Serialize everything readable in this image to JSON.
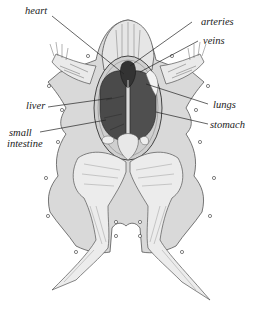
{
  "diagram": {
    "colors": {
      "skin": "#d9d9d9",
      "organ_dark": "#4a4a4a",
      "line": "#2a2a2a",
      "background": "#ffffff"
    },
    "labels": [
      {
        "id": "heart",
        "text": "heart",
        "side": "left"
      },
      {
        "id": "arteries",
        "text": "arteries",
        "side": "right"
      },
      {
        "id": "veins",
        "text": "veins",
        "side": "right"
      },
      {
        "id": "liver",
        "text": "liver",
        "side": "left"
      },
      {
        "id": "lungs",
        "text": "lungs",
        "side": "right"
      },
      {
        "id": "small_intestine",
        "text": "small intestine",
        "line1": "small",
        "line2": "intestine",
        "side": "left"
      },
      {
        "id": "stomach",
        "text": "stomach",
        "side": "right"
      }
    ]
  }
}
